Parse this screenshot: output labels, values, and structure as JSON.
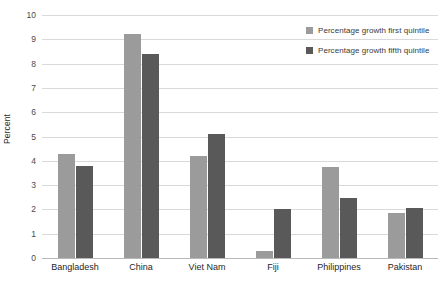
{
  "chart_data": {
    "type": "bar",
    "title": "",
    "subtitle": "",
    "xlabel": "",
    "ylabel": "Percent",
    "ylim": [
      0,
      10
    ],
    "ytick_labels": [
      "0",
      "1",
      "2",
      "3",
      "4",
      "5",
      "6",
      "7",
      "8",
      "9",
      "10"
    ],
    "ytick_values": [
      0,
      1,
      2,
      3,
      4,
      5,
      6,
      7,
      8,
      9,
      10
    ],
    "grid": true,
    "legend_position": "top-right",
    "categories": [
      "Bangladesh",
      "China",
      "Viet Nam",
      "Fiji",
      "Philippines",
      "Pakistan"
    ],
    "series": [
      {
        "name": "Percentage growth first quintile",
        "color": "#9b9b9b",
        "values": [
          4.3,
          9.2,
          4.2,
          0.3,
          3.75,
          1.85
        ]
      },
      {
        "name": "Percentage growth fifth quintile",
        "color": "#595959",
        "values": [
          3.8,
          8.4,
          5.1,
          2.0,
          2.45,
          2.05
        ]
      }
    ]
  },
  "legend": {
    "items": [
      {
        "label": "Percentage growth first quintile",
        "swatch": "first"
      },
      {
        "label": "Percentage growth fifth quintile",
        "swatch": "fifth"
      }
    ]
  },
  "colors": {
    "series_first": "#9b9b9b",
    "series_fifth": "#595959",
    "gridline": "#d9d9d9",
    "baseline": "#b8b8b8",
    "background": "#ffffff",
    "tick_text": "#4a4a4a",
    "category_text": "#1f1f1f"
  }
}
